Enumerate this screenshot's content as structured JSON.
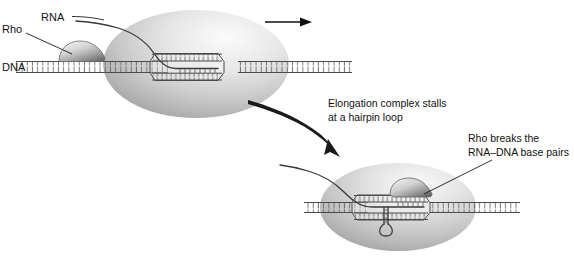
{
  "figure": {
    "background_color": "#ffffff"
  },
  "labels": {
    "rna": "RNA",
    "rho": "Rho",
    "dna": "DNA",
    "stall_line1": "Elongation complex stalls",
    "stall_line2": "at a hairpin loop",
    "breaks_line1": "Rho breaks the",
    "breaks_line2": "RNA–DNA base pairs"
  },
  "icons": {
    "direction_arrow": "arrow-right-icon",
    "transition_arrow": "curved-arrow-down-right-icon"
  },
  "colors": {
    "text": "#111111",
    "leader_line": "#1a1a1a",
    "rna_strand": "#3a3a3a",
    "dna_strand": "#4a4a4a",
    "polymerase_light": "#f2f2f2",
    "polymerase_mid": "#c9c9c9",
    "polymerase_dark": "#8d8d8d",
    "rho_light": "#efefef",
    "rho_dark": "#6f6f6f"
  },
  "panels": [
    {
      "id": "upper",
      "name": "elongating-complex",
      "polymerase": {
        "cx": 196,
        "cy": 64,
        "rx": 93,
        "ry": 54
      },
      "rho_position": "on-dna-upstream",
      "has_hairpin": false
    },
    {
      "id": "lower",
      "name": "stalled-complex",
      "polymerase": {
        "cx": 398,
        "cy": 207,
        "rx": 78,
        "ry": 44
      },
      "rho_position": "on-rna-inside-bubble",
      "has_hairpin": true
    }
  ]
}
